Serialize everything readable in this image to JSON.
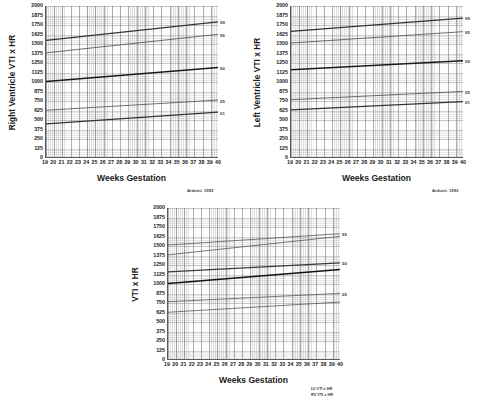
{
  "chart_data": [
    {
      "id": "right-ventricle",
      "type": "line",
      "title": "",
      "ylabel": "Right Ventricle VTI x HR",
      "xlabel": "Weeks Gestation",
      "attribution": "Arduini, 1993",
      "xlim": [
        19,
        40
      ],
      "ylim": [
        0,
        2000
      ],
      "grid": true,
      "xticks": [
        19,
        20,
        21,
        22,
        23,
        24,
        25,
        26,
        27,
        28,
        29,
        30,
        31,
        32,
        33,
        34,
        35,
        36,
        37,
        38,
        39,
        40
      ],
      "yticks": [
        0,
        125,
        250,
        375,
        500,
        625,
        750,
        875,
        1000,
        1125,
        1250,
        1375,
        1500,
        1625,
        1750,
        1875,
        2000
      ],
      "x": [
        19,
        40
      ],
      "series": [
        {
          "name": "99",
          "label": "99",
          "values": [
            1545,
            1790
          ],
          "color": "#333333",
          "width": 1.15
        },
        {
          "name": "95",
          "label": "95",
          "values": [
            1380,
            1625
          ],
          "color": "#555555",
          "width": 0.85
        },
        {
          "name": "50",
          "label": "50",
          "values": [
            1000,
            1185
          ],
          "color": "#1a1a1a",
          "width": 1.45
        },
        {
          "name": "05",
          "label": "05",
          "values": [
            620,
            755
          ],
          "color": "#555555",
          "width": 0.85
        },
        {
          "name": "01",
          "label": "01",
          "values": [
            440,
            595
          ],
          "color": "#333333",
          "width": 1.15
        }
      ]
    },
    {
      "id": "left-ventricle",
      "type": "line",
      "title": "",
      "ylabel": "Left Ventricle VTI x HR",
      "xlabel": "Weeks Gestation",
      "attribution": "Arduini, 1993",
      "xlim": [
        19,
        40
      ],
      "ylim": [
        0,
        2000
      ],
      "grid": true,
      "xticks": [
        19,
        20,
        21,
        22,
        23,
        24,
        25,
        26,
        27,
        28,
        29,
        30,
        31,
        32,
        33,
        34,
        35,
        36,
        37,
        38,
        39,
        40
      ],
      "yticks": [
        0,
        125,
        250,
        375,
        500,
        625,
        750,
        875,
        1000,
        1125,
        1250,
        1375,
        1500,
        1625,
        1750,
        1875,
        2000
      ],
      "x": [
        19,
        40
      ],
      "series": [
        {
          "name": "99",
          "label": "99",
          "values": [
            1665,
            1840
          ],
          "color": "#333333",
          "width": 1.15
        },
        {
          "name": "95",
          "label": "95",
          "values": [
            1510,
            1660
          ],
          "color": "#555555",
          "width": 0.85
        },
        {
          "name": "50",
          "label": "50",
          "values": [
            1155,
            1275
          ],
          "color": "#1a1a1a",
          "width": 1.45
        },
        {
          "name": "05",
          "label": "05",
          "values": [
            760,
            870
          ],
          "color": "#555555",
          "width": 0.85
        },
        {
          "name": "01",
          "label": "01",
          "values": [
            625,
            735
          ],
          "color": "#333333",
          "width": 1.15
        }
      ]
    },
    {
      "id": "combined",
      "type": "line",
      "title": "",
      "ylabel": "VTI x HR",
      "xlabel": "Weeks Gestation",
      "attribution": "",
      "xlim": [
        19,
        40
      ],
      "ylim": [
        0,
        2000
      ],
      "grid": true,
      "xticks": [
        19,
        20,
        21,
        22,
        23,
        24,
        25,
        26,
        27,
        28,
        29,
        30,
        31,
        32,
        33,
        34,
        35,
        36,
        37,
        38,
        39,
        40
      ],
      "yticks": [
        0,
        125,
        250,
        375,
        500,
        625,
        750,
        875,
        1000,
        1125,
        1250,
        1375,
        1500,
        1625,
        1750,
        1875,
        2000
      ],
      "x": [
        19,
        40
      ],
      "series": [
        {
          "name": "LV-95",
          "label": "95",
          "values": [
            1510,
            1660
          ],
          "color": "#606060",
          "width": 0.85
        },
        {
          "name": "RV-95",
          "label": "",
          "values": [
            1380,
            1625
          ],
          "color": "#606060",
          "width": 0.85
        },
        {
          "name": "LV-50",
          "label": "50",
          "values": [
            1155,
            1275
          ],
          "color": "#3a3a3a",
          "width": 1.25
        },
        {
          "name": "RV-50",
          "label": "",
          "values": [
            1000,
            1185
          ],
          "color": "#111111",
          "width": 1.5
        },
        {
          "name": "LV-05",
          "label": "05",
          "values": [
            760,
            870
          ],
          "color": "#606060",
          "width": 0.85
        },
        {
          "name": "RV-05",
          "label": "",
          "values": [
            620,
            755
          ],
          "color": "#606060",
          "width": 0.85
        }
      ],
      "legend": {
        "position": "bottom-right",
        "entries": [
          "LV VTI x HR",
          "RV VTI x HR"
        ]
      }
    }
  ],
  "charts": {
    "rv": {
      "ylabel": "Right Ventricle VTI x HR",
      "xlabel": "Weeks Gestation",
      "attribution": "Arduini, 1993"
    },
    "lv": {
      "ylabel": "Left Ventricle VTI x HR",
      "xlabel": "Weeks Gestation",
      "attribution": "Arduini, 1993"
    },
    "combined": {
      "ylabel": "VTI x HR",
      "xlabel": "Weeks Gestation",
      "legend_lv": "LV VTI x HR",
      "legend_rv": "RV VTI x HR"
    }
  },
  "colors": {
    "axis": "#5a5a5a",
    "grid_major": "#6e6e6e",
    "grid_minor": "#969696",
    "curve_outer": "#333333",
    "curve_inner": "#555555",
    "curve_median": "#1a1a1a",
    "text": "#1a1a1a",
    "background": "#ffffff"
  }
}
